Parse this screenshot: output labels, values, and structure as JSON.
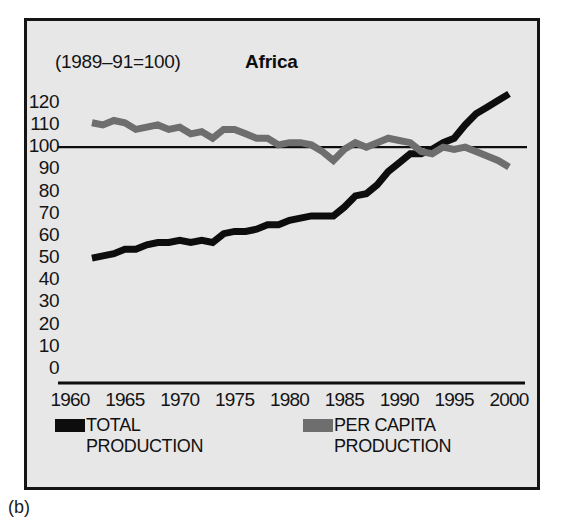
{
  "figure": {
    "caption": "(b)",
    "index_note": "(1989–91=100)",
    "title": "Africa"
  },
  "legend": {
    "position": "below-axis",
    "entries": [
      {
        "label": "TOTAL\nPRODUCTION",
        "color": "#0d0d0d",
        "swatch": "black-bar-swatch"
      },
      {
        "label": "PER CAPITA\nPRODUCTION",
        "color": "#6e6e6e",
        "swatch": "gray-bar-swatch"
      }
    ]
  },
  "chart_data": {
    "type": "line",
    "title": "Africa",
    "subtitle": "(1989–91=100)",
    "xlabel": "",
    "ylabel": "",
    "xlim": [
      1960,
      2001
    ],
    "ylim": [
      0,
      128
    ],
    "xticks": [
      1960,
      1965,
      1970,
      1975,
      1980,
      1985,
      1990,
      1995,
      2000
    ],
    "yticks": [
      0,
      10,
      20,
      30,
      40,
      50,
      60,
      70,
      80,
      90,
      100,
      110,
      120
    ],
    "grid": false,
    "reference_line": {
      "y": 100,
      "color": "#0d0d0d"
    },
    "series": [
      {
        "name": "TOTAL PRODUCTION",
        "color": "#0d0d0d",
        "x": [
          1962,
          1963,
          1964,
          1965,
          1966,
          1967,
          1968,
          1969,
          1970,
          1971,
          1972,
          1973,
          1974,
          1975,
          1976,
          1977,
          1978,
          1979,
          1980,
          1981,
          1982,
          1983,
          1984,
          1985,
          1986,
          1987,
          1988,
          1989,
          1990,
          1991,
          1992,
          1993,
          1994,
          1995,
          1996,
          1997,
          1998,
          1999,
          2000
        ],
        "values": [
          50,
          51,
          52,
          54,
          54,
          56,
          57,
          57,
          58,
          57,
          58,
          57,
          61,
          62,
          62,
          63,
          65,
          65,
          67,
          68,
          69,
          69,
          69,
          73,
          78,
          79,
          83,
          89,
          93,
          97,
          97,
          99,
          102,
          104,
          110,
          115,
          118,
          121,
          124
        ]
      },
      {
        "name": "PER CAPITA PRODUCTION",
        "color": "#6e6e6e",
        "x": [
          1962,
          1963,
          1964,
          1965,
          1966,
          1967,
          1968,
          1969,
          1970,
          1971,
          1972,
          1973,
          1974,
          1975,
          1976,
          1977,
          1978,
          1979,
          1980,
          1981,
          1982,
          1983,
          1984,
          1985,
          1986,
          1987,
          1988,
          1989,
          1990,
          1991,
          1992,
          1993,
          1994,
          1995,
          1996,
          1997,
          1998,
          1999,
          2000
        ],
        "values": [
          111,
          110,
          112,
          111,
          108,
          109,
          110,
          108,
          109,
          106,
          107,
          104,
          108,
          108,
          106,
          104,
          104,
          101,
          102,
          102,
          101,
          98,
          94,
          99,
          102,
          100,
          102,
          104,
          103,
          102,
          98,
          97,
          100,
          99,
          100,
          98,
          96,
          94,
          91
        ]
      }
    ]
  }
}
